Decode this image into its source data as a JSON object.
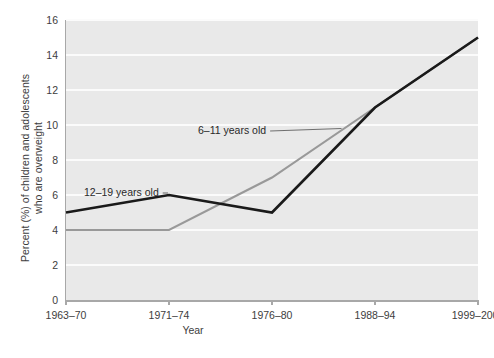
{
  "chart_data": {
    "type": "line",
    "title": "",
    "xlabel": "Year",
    "ylabel": "Percent (%) of children and adolescents who are overweight",
    "ylabel_line1": "Percent (%) of children and adolescents",
    "ylabel_line2": "who are overweight",
    "categories": [
      "1963–70",
      "1971–74",
      "1976–80",
      "1988–94",
      "1999–2000"
    ],
    "yticks": [
      0,
      2,
      4,
      6,
      8,
      10,
      12,
      14,
      16
    ],
    "ylim": [
      0,
      16
    ],
    "grid": "horizontal-white",
    "legend_position": "inline-annotations",
    "series": [
      {
        "name": "6–11 years old",
        "color": "#999999",
        "values": [
          4,
          4,
          7,
          11,
          15
        ],
        "annotation": "6–11 years old"
      },
      {
        "name": "12–19 years old",
        "color": "#1a1a1a",
        "values": [
          5,
          6,
          5,
          11,
          15
        ],
        "annotation": "12–19 years old"
      }
    ]
  },
  "axes": {
    "y_title_line1": "Percent (%) of children and adolescents",
    "y_title_line2": "who are overweight",
    "x_title": "Year",
    "y_tick_labels": [
      "0",
      "2",
      "4",
      "6",
      "8",
      "10",
      "12",
      "14",
      "16"
    ],
    "x_tick_labels": [
      "1963–70",
      "1971–74",
      "1976–80",
      "1988–94",
      "1999–2000"
    ]
  },
  "annotations": {
    "series_6_11": "6–11 years old",
    "series_12_19": "12–19 years old"
  },
  "caption": {
    "text": ""
  },
  "colors": {
    "plot_background": "#e9e9e9",
    "gridline": "#fbfbfb",
    "axis": "#a8a8a8",
    "series_6_11": "#999999",
    "series_12_19": "#1a1a1a",
    "text": "#3d3d3d",
    "page_background": "#ffffff"
  }
}
